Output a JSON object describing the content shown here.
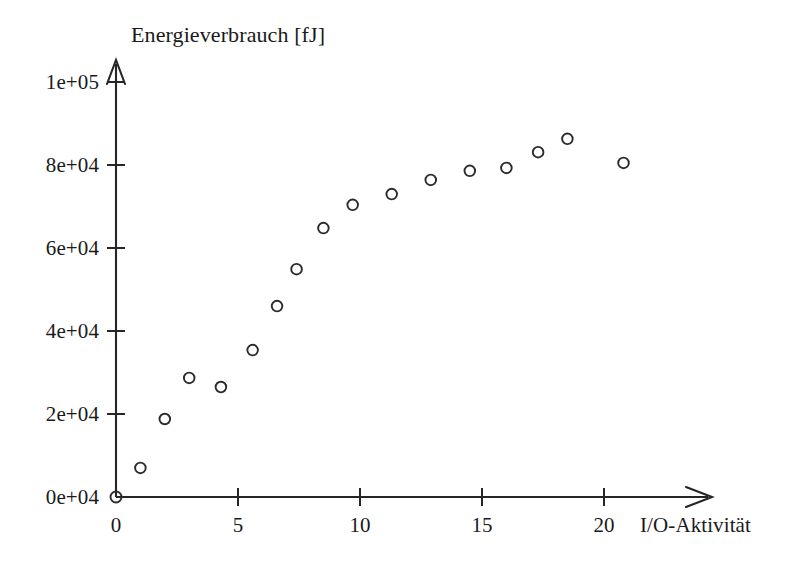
{
  "chart_data": {
    "type": "scatter",
    "title": "Energieverbrauch [fJ]",
    "xlabel": "I/O-Aktivität",
    "ylabel": "Energieverbrauch [fJ]",
    "xlim": [
      0,
      21.5
    ],
    "ylim": [
      0,
      105000
    ],
    "grid": false,
    "legend": "none",
    "marker": "open-circle",
    "x_tick_labels": [
      "0",
      "5",
      "10",
      "15",
      "20"
    ],
    "x_ticks": [
      0,
      5,
      10,
      15,
      20
    ],
    "y_tick_labels": [
      "0e+04",
      "2e+04",
      "4e+04",
      "6e+04",
      "8e+04",
      "1e+05"
    ],
    "y_ticks": [
      0,
      20000,
      40000,
      60000,
      80000,
      100000
    ],
    "series": [
      {
        "name": "Energieverbrauch",
        "points": [
          {
            "x": 1.0,
            "y": 7000
          },
          {
            "x": 2.0,
            "y": 18800
          },
          {
            "x": 3.0,
            "y": 28700
          },
          {
            "x": 4.3,
            "y": 26500
          },
          {
            "x": 5.6,
            "y": 35400
          },
          {
            "x": 6.6,
            "y": 46000
          },
          {
            "x": 7.4,
            "y": 54900
          },
          {
            "x": 8.5,
            "y": 64800
          },
          {
            "x": 9.7,
            "y": 70400
          },
          {
            "x": 11.3,
            "y": 73000
          },
          {
            "x": 12.9,
            "y": 76400
          },
          {
            "x": 14.5,
            "y": 78600
          },
          {
            "x": 16.0,
            "y": 79300
          },
          {
            "x": 17.3,
            "y": 83100
          },
          {
            "x": 18.5,
            "y": 86300
          },
          {
            "x": 20.8,
            "y": 80500
          }
        ]
      }
    ]
  },
  "axes": {
    "y_axis_arrow": "arrow-up",
    "x_axis_arrow": "arrow-right"
  },
  "colors": {
    "ink": "#262626",
    "marker": "#2b2b2b",
    "background": "#ffffff"
  }
}
